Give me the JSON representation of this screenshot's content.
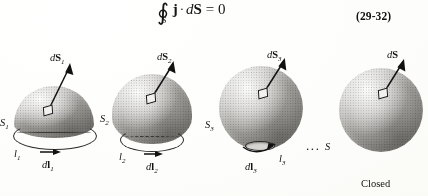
{
  "equation": {
    "integral_symbol": "∮",
    "integral_subscript": "S",
    "integrand_vector": "j",
    "dot_operator": "·",
    "differential": "d",
    "surface_vector": "S",
    "equals": "= 0",
    "number": "(29-32)"
  },
  "figures": [
    {
      "id": "figure-1",
      "shape": "hemisphere",
      "surface_label": "S",
      "surface_subscript": "1",
      "boundary_label": "l",
      "boundary_subscript": "1",
      "boundary_element_label": "dl",
      "boundary_element_subscript": "1",
      "area_element_label": "dS",
      "area_element_subscript": "1"
    },
    {
      "id": "figure-2",
      "shape": "spherical-cap",
      "surface_label": "S",
      "surface_subscript": "2",
      "boundary_label": "l",
      "boundary_subscript": "2",
      "boundary_element_label": "dl",
      "boundary_element_subscript": "2",
      "area_element_label": "dS",
      "area_element_subscript": "2"
    },
    {
      "id": "figure-3",
      "shape": "near-closed-sphere",
      "surface_label": "S",
      "surface_subscript": "3",
      "boundary_label": "l",
      "boundary_subscript": "3",
      "boundary_element_label": "dl",
      "boundary_element_subscript": "3",
      "area_element_label": "dS",
      "area_element_subscript": "3"
    },
    {
      "id": "figure-4",
      "shape": "closed-sphere",
      "surface_label": "S",
      "surface_subscript": "",
      "area_element_label": "dS",
      "area_element_subscript": "",
      "caption": "Closed"
    }
  ],
  "ellipsis": "...",
  "colors": {
    "background": "#fdfdfc",
    "ink": "#121212",
    "solid_mid": "#bdbcb8",
    "solid_shadow": "#4a4845",
    "solid_highlight": "#ffffff"
  }
}
